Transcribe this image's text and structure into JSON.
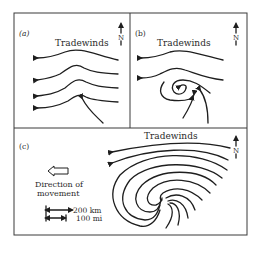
{
  "panels": {
    "a": {
      "label": "(a)",
      "title": "Tradewinds",
      "north": "N"
    },
    "b": {
      "label": "(b)",
      "title": "Tradewinds",
      "north": "N"
    },
    "c": {
      "label": "(c)",
      "title": "Tradewinds",
      "north": "N",
      "movement_label_line1": "Direction of",
      "movement_label_line2": "movement",
      "scale_km": "200 km",
      "scale_mi": "100 mi"
    }
  },
  "colors": {
    "ink": "#1e1e1e",
    "frame": "#3a3a3a",
    "background": "#ffffff"
  }
}
